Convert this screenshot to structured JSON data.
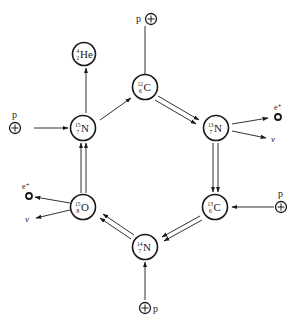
{
  "diagram": {
    "nuclei": [
      {
        "id": "c12",
        "symbol": "C",
        "mass": "12",
        "charge": "6",
        "x": 145,
        "y": 87
      },
      {
        "id": "n13",
        "symbol": "N",
        "mass": "13",
        "charge": "7",
        "x": 216,
        "y": 128
      },
      {
        "id": "c13",
        "symbol": "C",
        "mass": "13",
        "charge": "6",
        "x": 215,
        "y": 207
      },
      {
        "id": "n14",
        "symbol": "N",
        "mass": "14",
        "charge": "7",
        "x": 145,
        "y": 247
      },
      {
        "id": "o15",
        "symbol": "O",
        "mass": "15",
        "charge": "8",
        "x": 83,
        "y": 207
      },
      {
        "id": "n15",
        "symbol": "N",
        "mass": "15",
        "charge": "7",
        "x": 83,
        "y": 128
      },
      {
        "id": "he4",
        "symbol": "He",
        "mass": "4",
        "charge": "2",
        "x": 83,
        "y": 53
      }
    ],
    "particles": {
      "proton_label": "p",
      "positron_label": "e⁺",
      "neutrino_label": "v",
      "proton_icon": "⊕"
    },
    "steps": [
      {
        "from": "c12",
        "to": "n13",
        "type": "double-arrow",
        "input": "p"
      },
      {
        "from": "n13",
        "to": "c13",
        "type": "double-arrow",
        "outputs": [
          "e⁺",
          "v"
        ]
      },
      {
        "from": "c13",
        "to": "n14",
        "type": "double-arrow",
        "input": "p"
      },
      {
        "from": "n14",
        "to": "o15",
        "type": "double-arrow",
        "input": "p"
      },
      {
        "from": "o15",
        "to": "n15",
        "type": "double-arrow",
        "outputs": [
          "e⁺",
          "v"
        ]
      },
      {
        "from": "n15",
        "to": "c12",
        "type": "arrow",
        "input": "p",
        "output": "he4"
      }
    ]
  }
}
